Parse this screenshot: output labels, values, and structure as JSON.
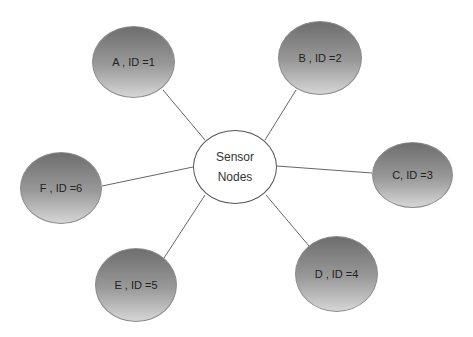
{
  "hub": {
    "line1": "Sensor",
    "line2": "Nodes"
  },
  "nodes": [
    {
      "label": "A , ID =1"
    },
    {
      "label": "B , ID =2"
    },
    {
      "label": "C, ID =3"
    },
    {
      "label": "D , ID =4"
    },
    {
      "label": "E , ID =5"
    },
    {
      "label": "F , ID =6"
    }
  ],
  "colors": {
    "node_top": "#6e6e6e",
    "node_bottom": "#d6d6d6",
    "line": "#666666"
  }
}
